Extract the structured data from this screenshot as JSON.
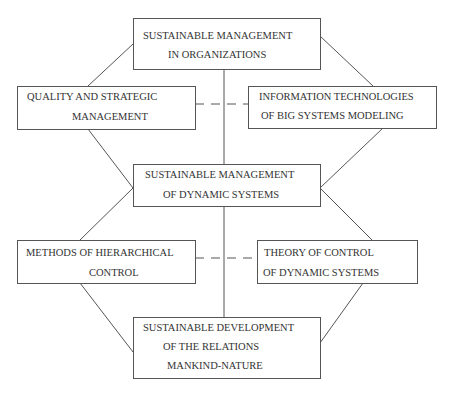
{
  "diagram": {
    "nodes": {
      "top": {
        "lines": [
          "SUSTAINABLE MANAGEMENT",
          "IN ORGANIZATIONS"
        ]
      },
      "quality": {
        "lines": [
          "QUALITY AND STRATEGIC",
          "MANAGEMENT"
        ]
      },
      "info": {
        "lines": [
          "INFORMATION TECHNOLOGIES",
          "OF BIG SYSTEMS MODELING"
        ]
      },
      "center": {
        "lines": [
          "SUSTAINABLE MANAGEMENT",
          "OF DYNAMIC SYSTEMS"
        ]
      },
      "methods": {
        "lines": [
          "METHODS OF HIERARCHICAL",
          "CONTROL"
        ]
      },
      "theory": {
        "lines": [
          "THEORY OF CONTROL",
          "OF DYNAMIC SYSTEMS"
        ]
      },
      "bottom": {
        "lines": [
          "SUSTAINABLE DEVELOPMENT",
          "OF THE RELATIONS",
          "MANKIND-NATURE"
        ]
      }
    },
    "colors": {
      "stroke": "#555555",
      "text": "#333333",
      "background": "#ffffff"
    }
  }
}
